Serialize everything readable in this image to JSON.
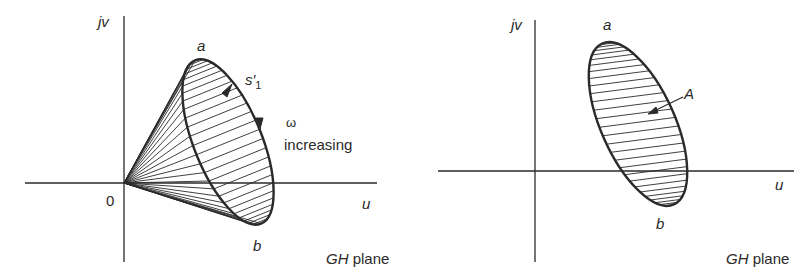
{
  "left_diagram": {
    "axis_v_label": "jv",
    "axis_h_label": "u",
    "origin_label": "0",
    "point_a": "a",
    "point_b": "b",
    "contour_label": "s",
    "contour_prime": "′",
    "contour_sub": "1",
    "omega_label": "ω",
    "increasing_label": "increasing",
    "plane_label_italic": "GH",
    "plane_label_rest": " plane"
  },
  "right_diagram": {
    "axis_v_label": "jv",
    "axis_h_label": "u",
    "point_a": "a",
    "point_b": "b",
    "region_label": "A",
    "plane_label_italic": "GH",
    "plane_label_rest": " plane"
  },
  "colors": {
    "ink": "#2a2a2a",
    "background": "#ffffff"
  }
}
